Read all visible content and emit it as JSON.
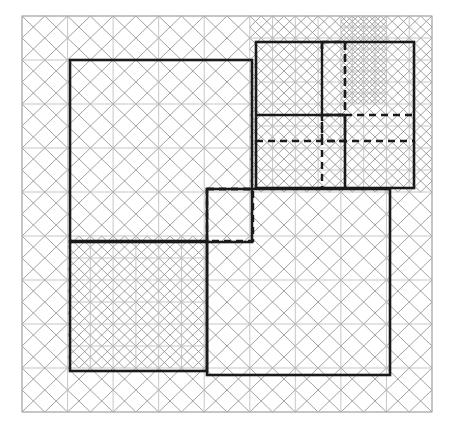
{
  "figure": {
    "type": "geometric-diagram",
    "canvas": {
      "width": 457,
      "height": 432,
      "background": "#ffffff"
    },
    "colors": {
      "background": "#ffffff",
      "grid_line": "#b9b9b9",
      "pattern_line": "#8a8a8a",
      "outline_bold": "#1a1a1a",
      "outline_dashed": "#1a1a1a",
      "border": "#a8a8a8"
    },
    "stroke_widths": {
      "grid_line": 0.8,
      "pattern_line": 0.8,
      "outline_bold": 2.6,
      "outline_dashed": 2.4,
      "border": 1.0
    }
  },
  "board": {
    "name": "outer-board",
    "x": 22,
    "y": 16,
    "width": 410,
    "height": 396,
    "columns": 9,
    "rows": 9,
    "cell_width": 45.56,
    "cell_height": 44.0
  },
  "pattern": {
    "description": "Each background cell carries an inscribed rotated square (midpoint square) plus its diagonals, producing a pinwheel / basket-weave texture.",
    "unit": "midpoint-square",
    "refinement_regions": [
      {
        "name": "top-right-fine",
        "col0": 5,
        "row0": 0,
        "col1": 9,
        "row1": 4,
        "subdivision": 2
      },
      {
        "name": "bottom-left-fine",
        "col0": 1,
        "row0": 5,
        "col1": 4,
        "row1": 8,
        "subdivision": 2
      },
      {
        "name": "top-right-extra-fine",
        "col0": 7,
        "row0": 0,
        "col1": 8,
        "row1": 2,
        "subdivision": 4
      }
    ]
  },
  "shapes": {
    "bold_squares": [
      {
        "id": "square-upper-left",
        "label": "Upper-left square",
        "x": 70,
        "y": 60,
        "width": 182,
        "height": 182,
        "grid_cells": 4
      },
      {
        "id": "square-upper-right",
        "label": "Upper-right square",
        "x": 256,
        "y": 42,
        "width": 158,
        "height": 146,
        "grid_cells": 3
      },
      {
        "id": "square-lower-left",
        "label": "Lower-left square",
        "x": 70,
        "y": 241,
        "width": 137,
        "height": 130,
        "grid_cells": 3
      },
      {
        "id": "square-lower-right",
        "label": "Lower-right square",
        "x": 207,
        "y": 189,
        "width": 183,
        "height": 186,
        "grid_cells": 4
      }
    ],
    "bold_inner_lines": [
      {
        "id": "upper-right-divider-horizontal",
        "x1": 256,
        "y1": 115,
        "x2": 345,
        "y2": 115
      },
      {
        "id": "upper-right-divider-vertical",
        "x1": 345,
        "y1": 115,
        "x2": 345,
        "y2": 188
      },
      {
        "id": "upper-right-tick-vertical",
        "x1": 322,
        "y1": 42,
        "x2": 322,
        "y2": 49
      }
    ],
    "dashed_squares": [
      {
        "id": "dashed-center-square",
        "label": "Centre dashed square",
        "x": 207,
        "y": 189,
        "width": 46,
        "height": 52
      },
      {
        "id": "dashed-upper-right-a",
        "label": "Upper-right dashed a",
        "x": 322,
        "y": 42,
        "width": 23,
        "height": 73
      },
      {
        "id": "dashed-upper-right-b",
        "label": "Upper-right dashed b",
        "x": 322,
        "y": 115,
        "width": 23,
        "height": 26
      }
    ],
    "dashed_lines": [
      {
        "id": "dash-v-1",
        "x1": 322,
        "y1": 42,
        "x2": 322,
        "y2": 188
      },
      {
        "id": "dash-v-2",
        "x1": 345,
        "y1": 42,
        "x2": 345,
        "y2": 115
      },
      {
        "id": "dash-h-1",
        "x1": 345,
        "y1": 115,
        "x2": 414,
        "y2": 115
      },
      {
        "id": "dash-h-2",
        "x1": 256,
        "y1": 141,
        "x2": 414,
        "y2": 141
      },
      {
        "id": "dash-c-top",
        "x1": 207,
        "y1": 189,
        "x2": 253,
        "y2": 189
      },
      {
        "id": "dash-c-left",
        "x1": 207,
        "y1": 189,
        "x2": 207,
        "y2": 241
      }
    ]
  },
  "annotations": {
    "visible_text": [],
    "note": "The figure contains no labels, axis ticks, legend or caption text."
  }
}
